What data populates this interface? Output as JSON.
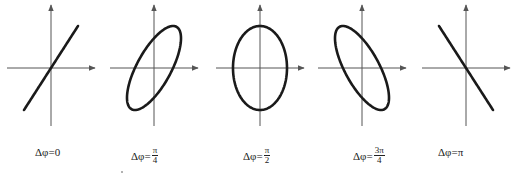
{
  "figure": {
    "axis_color": "#555555",
    "curve_color": "#1a1a1a",
    "panels": [
      {
        "id": "p0",
        "phase": "0",
        "label_prefix": "Δφ=",
        "label_value": "0",
        "fraction": null,
        "shape": "line-positive",
        "phase_rad": 0
      },
      {
        "id": "p1",
        "phase": "π/4",
        "label_prefix": "Δφ=",
        "label_value": "",
        "fraction": {
          "num": "π",
          "den": "4"
        },
        "shape": "ellipse-positive",
        "phase_rad": 0.7853981634
      },
      {
        "id": "p2",
        "phase": "π/2",
        "label_prefix": "Δφ=",
        "label_value": "",
        "fraction": {
          "num": "π",
          "den": "2"
        },
        "shape": "ellipse-upright",
        "phase_rad": 1.5707963268
      },
      {
        "id": "p3",
        "phase": "3π/4",
        "label_prefix": "Δφ=",
        "label_value": "",
        "fraction": {
          "num": "3π",
          "den": "4"
        },
        "shape": "ellipse-negative",
        "phase_rad": 2.3561944902
      },
      {
        "id": "p4",
        "phase": "π",
        "label_prefix": "Δφ=",
        "label_value": "π",
        "fraction": null,
        "shape": "line-negative",
        "phase_rad": 3.1415926536
      }
    ]
  }
}
